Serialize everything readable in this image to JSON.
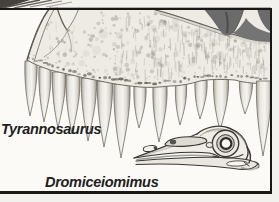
{
  "figure": {
    "labels": {
      "tyrannosaurus": "Tyrannosaurus",
      "dromiceiomimus": "Dromiceiomimus"
    },
    "colors": {
      "frame": "#181715",
      "paper": "#fbfaf7",
      "margin": "#f2f1ee",
      "bone": "#edebe4",
      "fenestra_shadow": "#6b6b6b",
      "label_ink": "#1f1e1c"
    }
  }
}
